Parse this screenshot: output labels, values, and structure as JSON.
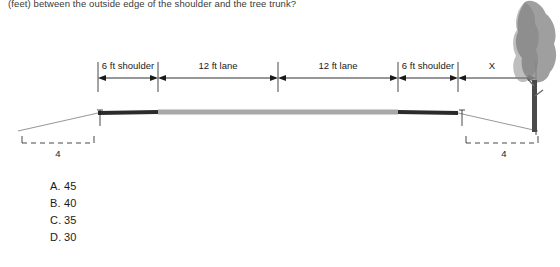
{
  "question": {
    "prompt": "(feet) between the outside edge of the shoulder and the tree trunk?"
  },
  "figure": {
    "labels": {
      "left_shoulder": "6 ft shoulder",
      "left_lane": "12 ft lane",
      "right_lane": "12 ft lane",
      "right_shoulder": "6 ft shoulder",
      "unknown": "X",
      "left_slope": "4",
      "right_slope": "4"
    }
  },
  "choices": [
    {
      "letter": "A.",
      "value": "45"
    },
    {
      "letter": "B.",
      "value": "40"
    },
    {
      "letter": "C.",
      "value": "35"
    },
    {
      "letter": "D.",
      "value": "30"
    }
  ],
  "colors": {
    "pavement": "#a8a8a8",
    "shoulder_dark": "#2b2b2b",
    "slope_line": "#9a9a9a",
    "dimension_line": "#1a1a1a",
    "tree_foliage": "#8e8e8e",
    "tree_trunk": "#4a4a4a",
    "text": "#1a1a1a"
  }
}
